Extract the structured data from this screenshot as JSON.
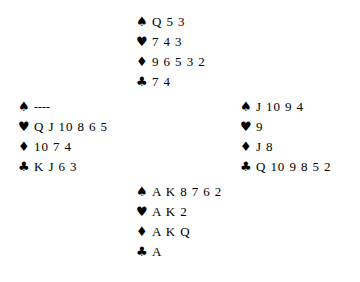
{
  "diagram": {
    "type": "bridge-hand-diagram",
    "suit_symbols": {
      "spade": "♠",
      "heart": "♥",
      "diamond": "♦",
      "club": "♣"
    },
    "text_color": "#000000",
    "background_color": "#ffffff",
    "hands": {
      "north": {
        "spades": "Q 5 3",
        "hearts": "7 4 3",
        "diamonds": "9 6 5 3 2",
        "clubs": "7 4"
      },
      "west": {
        "spades": "----",
        "hearts": "Q J 10 8 6 5",
        "diamonds": "10 7 4",
        "clubs": "K J 6 3"
      },
      "east": {
        "spades": "J 10 9 4",
        "hearts": "9",
        "diamonds": "J 8",
        "clubs": "Q 10 9 8 5 2"
      },
      "south": {
        "spades": "A K 8 7 6 2",
        "hearts": "A K 2",
        "diamonds": "A K Q",
        "clubs": "A"
      }
    }
  }
}
